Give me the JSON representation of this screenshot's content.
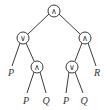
{
  "diagram": {
    "type": "expression-tree",
    "colors": {
      "stroke": "#3a3a3a",
      "text": "#333333",
      "background": "#ffffff"
    },
    "nodes": {
      "root": {
        "symbol": "∧",
        "x": 54,
        "y": 11
      },
      "left": {
        "symbol": "∨",
        "x": 23,
        "y": 38
      },
      "right": {
        "symbol": "∧",
        "x": 85,
        "y": 38
      },
      "left_right": {
        "symbol": "∧",
        "x": 37,
        "y": 67
      },
      "right_left": {
        "symbol": "∨",
        "x": 72,
        "y": 67
      }
    },
    "leaves": {
      "left_left": {
        "label": "P",
        "x": 11,
        "y": 75
      },
      "left_right_left": {
        "label": "P",
        "x": 26,
        "y": 103
      },
      "left_right_right": {
        "label": "Q",
        "x": 46,
        "y": 103
      },
      "right_left_left": {
        "label": "P",
        "x": 66,
        "y": 103
      },
      "right_left_right": {
        "label": "Q",
        "x": 84,
        "y": 103
      },
      "right_right": {
        "label": "R",
        "x": 97,
        "y": 75
      }
    }
  }
}
